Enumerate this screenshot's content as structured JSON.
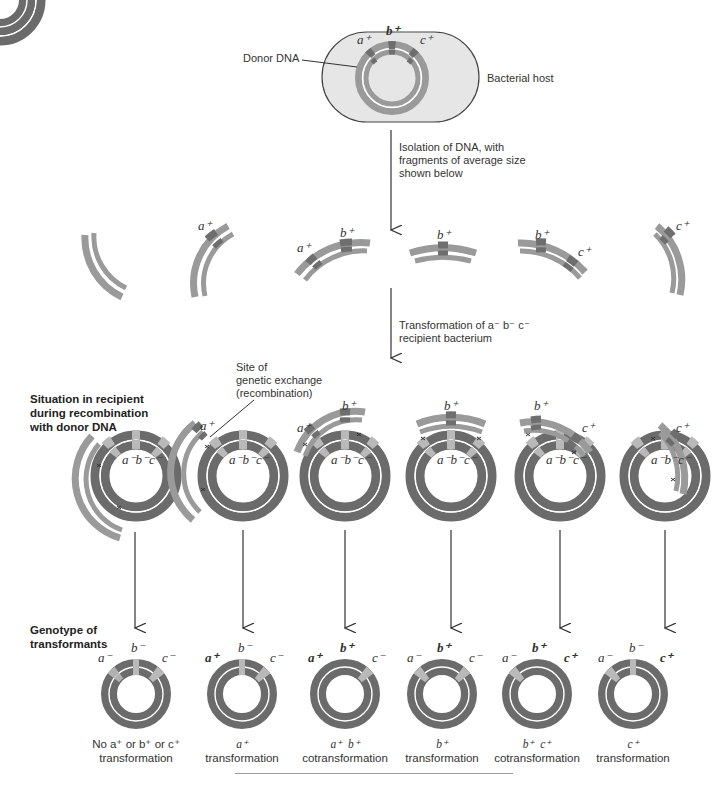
{
  "colors": {
    "host_fill": "#e6e6e6",
    "donor_ring": "#9a9a9a",
    "donor_marker": "#6e6e6e",
    "recipient_ring": "#6b6b6b",
    "recipient_marker": "#b9b9b9",
    "arrow": "#333333"
  },
  "top": {
    "donor_label": "Donor DNA",
    "host_label": "Bacterial host",
    "genes": [
      "a⁺",
      "b⁺",
      "c⁺"
    ]
  },
  "step1": {
    "line1": "Isolation of DNA, with",
    "line2": "fragments of average size",
    "line3": "shown below"
  },
  "fragments": [
    {
      "genes": []
    },
    {
      "genes": [
        "a⁺"
      ]
    },
    {
      "genes": [
        "a⁺",
        "b⁺"
      ]
    },
    {
      "genes": [
        "b⁺"
      ]
    },
    {
      "genes": [
        "b⁺",
        "c⁺"
      ]
    },
    {
      "genes": [
        "c⁺"
      ]
    }
  ],
  "step2": {
    "line1": "Transformation of a⁻ b⁻ c⁻",
    "line2": "recipient bacterium"
  },
  "recombination": {
    "heading_line1": "Situation in recipient",
    "heading_line2": "during recombination",
    "heading_line3": "with donor DNA",
    "site_line1": "Site of",
    "site_line2": "genetic exchange",
    "site_line3": "(recombination)",
    "recipient_genotype": "a⁻b⁻c⁻"
  },
  "transformants": {
    "heading_line1": "Genotype of",
    "heading_line2": "transformants",
    "items": [
      {
        "a": "a⁻",
        "b": "b⁻",
        "c": "c⁻",
        "cap1": "No a⁺ or b⁺ or c⁺",
        "cap2": "transformation"
      },
      {
        "a": "a⁺",
        "b": "b⁻",
        "c": "c⁻",
        "cap1": "a⁺",
        "cap2": "transformation"
      },
      {
        "a": "a⁺",
        "b": "b⁺",
        "c": "c⁻",
        "cap1": "a⁺  b⁺",
        "cap2": "cotransformation"
      },
      {
        "a": "a⁻",
        "b": "b⁺",
        "c": "c⁻",
        "cap1": "b⁺",
        "cap2": "transformation"
      },
      {
        "a": "a⁻",
        "b": "b⁺",
        "c": "c⁺",
        "cap1": "b⁺  c⁺",
        "cap2": "cotransformation"
      },
      {
        "a": "a⁻",
        "b": "b⁻",
        "c": "c⁺",
        "cap1": "c⁺",
        "cap2": "transformation"
      }
    ]
  }
}
